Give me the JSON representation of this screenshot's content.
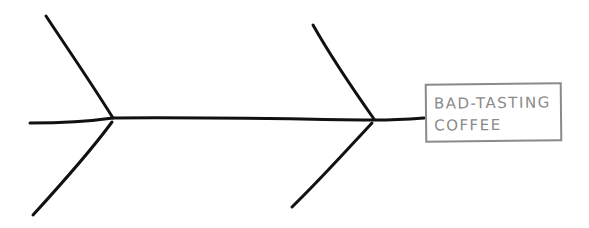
{
  "diagram": {
    "type": "fishbone",
    "effect": {
      "line1": "BAD-TASTING",
      "line2": "COFFEE"
    },
    "colors": {
      "bones": "#111111",
      "effect_box": "#8a8a8a",
      "background": "#ffffff"
    },
    "bones": {
      "spine_count": 1,
      "cause_branches": 4
    }
  }
}
